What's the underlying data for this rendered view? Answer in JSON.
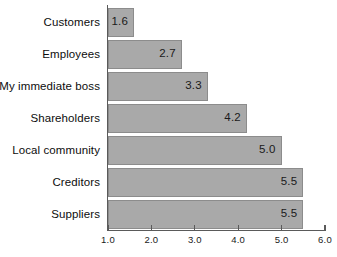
{
  "chart_data": {
    "type": "bar",
    "orientation": "horizontal",
    "title": "",
    "subtitle": "",
    "xlabel": "",
    "ylabel": "",
    "categories": [
      "Customers",
      "Employees",
      "My immediate boss",
      "Shareholders",
      "Local community",
      "Creditors",
      "Suppliers"
    ],
    "values": [
      1.6,
      2.7,
      3.3,
      4.2,
      5.0,
      5.5,
      5.5
    ],
    "value_labels": [
      "1.6",
      "2.7",
      "3.3",
      "4.2",
      "5.0",
      "5.5",
      "5.5"
    ],
    "xlim": [
      1.0,
      6.0
    ],
    "xticks": [
      1.0,
      2.0,
      3.0,
      4.0,
      5.0,
      6.0
    ],
    "xtick_labels": [
      "1.0",
      "2.0",
      "3.0",
      "4.0",
      "5.0",
      "6.0"
    ],
    "grid": false,
    "legend": null,
    "bar_color": "#a9a9a9",
    "bar_border_color": "#8c8c8c",
    "axis_color": "#5a5a5a",
    "text_color": "#0d0d0d",
    "background": "#ffffff",
    "data_labels_inside": true
  }
}
